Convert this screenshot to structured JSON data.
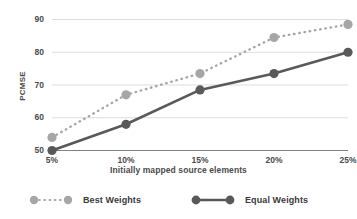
{
  "chart_data": {
    "type": "line",
    "title": "",
    "xlabel": "Initially mapped source elements",
    "ylabel": "PCMSE",
    "categories": [
      "5%",
      "10%",
      "15%",
      "20%",
      "25%"
    ],
    "ytick_labels": [
      "50",
      "60",
      "70",
      "80",
      "90"
    ],
    "ylim": [
      50,
      90
    ],
    "grid": true,
    "legend_position": "bottom",
    "series": [
      {
        "name": "Best Weights",
        "color": "#a6a6a6",
        "linestyle": "dotted",
        "marker": "circle",
        "values": [
          54,
          67,
          73.5,
          84.5,
          88.5
        ]
      },
      {
        "name": "Equal Weights",
        "color": "#595959",
        "linestyle": "solid",
        "marker": "circle",
        "values": [
          50,
          58,
          68.5,
          73.5,
          80
        ]
      }
    ]
  },
  "colors": {
    "best_weights": "#a6a6a6",
    "equal_weights": "#595959",
    "gridline": "#d4d4d4",
    "axis": "#808080",
    "text": "#4a4a4a",
    "background": "#ffffff"
  }
}
